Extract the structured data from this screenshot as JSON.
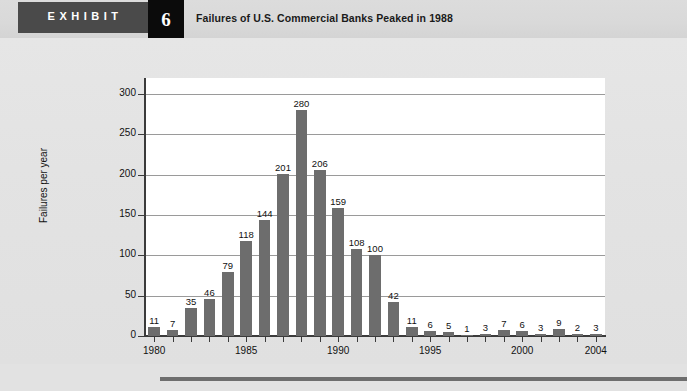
{
  "header": {
    "exhibit_label": "EXHIBIT",
    "exhibit_number": "6",
    "title": "Failures of U.S. Commercial Banks Peaked in 1988"
  },
  "colors": {
    "bar": "#6d6d6d",
    "background": "#e2e2e2",
    "plot_background": "#ffffff",
    "gridline": "#9a9a9a",
    "axis": "#3b3b3b",
    "tag_background": "#4a4a4a",
    "number_background": "#0b0b0b"
  },
  "chart_data": {
    "type": "bar",
    "title": "Failures of U.S. Commercial Banks Peaked in 1988",
    "xlabel": "",
    "ylabel": "Failures per year",
    "ylim": [
      0,
      320
    ],
    "yticks": [
      0,
      50,
      100,
      150,
      200,
      250,
      300
    ],
    "ytick_labels": [
      "0",
      "50",
      "100",
      "150",
      "200",
      "250",
      "300"
    ],
    "grid": true,
    "legend": "none",
    "xtick_labels": [
      "1980",
      "1985",
      "1990",
      "1995",
      "2000",
      "2004"
    ],
    "categories": [
      "1980",
      "1981",
      "1982",
      "1983",
      "1984",
      "1985",
      "1986",
      "1987",
      "1988",
      "1989",
      "1990",
      "1991",
      "1992",
      "1993",
      "1994",
      "1995",
      "1996",
      "1997",
      "1998",
      "1999",
      "2000",
      "2001",
      "2002",
      "2003",
      "2004"
    ],
    "values": [
      11,
      7,
      35,
      46,
      79,
      118,
      144,
      201,
      280,
      206,
      159,
      108,
      100,
      42,
      11,
      6,
      5,
      1,
      3,
      7,
      6,
      3,
      9,
      2,
      3
    ],
    "data_labels": [
      "11",
      "7",
      "35",
      "46",
      "79",
      "118",
      "144",
      "201",
      "280",
      "206",
      "159",
      "108",
      "100",
      "42",
      "11",
      "6",
      "5",
      "1",
      "3",
      "7",
      "6",
      "3",
      "9",
      "2",
      "3"
    ]
  }
}
